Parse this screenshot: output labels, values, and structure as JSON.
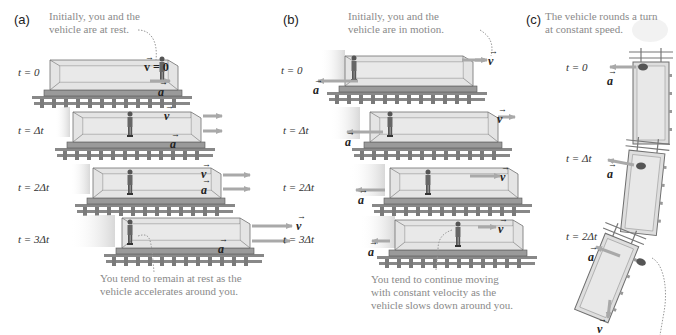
{
  "panels": [
    {
      "id": "a",
      "letter": "(a)",
      "top_caption": [
        "Initially, you and the",
        "vehicle are at rest."
      ],
      "bottom_caption": [
        "You tend to remain at rest as the",
        "vehicle accelerates around you."
      ],
      "initial_velocity_label": "v = 0",
      "rows": [
        {
          "t": "t = 0",
          "v": "",
          "a": "a"
        },
        {
          "t": "t = Δt",
          "v": "v",
          "a": "a"
        },
        {
          "t": "t = 2Δt",
          "v": "v",
          "a": "a"
        },
        {
          "t": "t = 3Δt",
          "v": "v",
          "a": "a"
        }
      ]
    },
    {
      "id": "b",
      "letter": "(b)",
      "top_caption": [
        "Initially, you and the",
        "vehicle are in motion."
      ],
      "bottom_caption": [
        "You tend to continue moving",
        "with constant velocity as the",
        "vehicle slows down around you."
      ],
      "rows": [
        {
          "t": "t = 0",
          "v": "v",
          "a": "a"
        },
        {
          "t": "t = Δt",
          "v": "v",
          "a": "a"
        },
        {
          "t": "t = 2Δt",
          "v": "v",
          "a": "a"
        },
        {
          "t": "t = 3Δt",
          "v": "v",
          "a": "a"
        }
      ]
    },
    {
      "id": "c",
      "letter": "(c)",
      "top_caption": [
        "The vehicle rounds a turn",
        "at constant speed."
      ],
      "rows": [
        {
          "t": "t = 0",
          "a": "a"
        },
        {
          "t": "t = Δt",
          "a": "a"
        },
        {
          "t": "t = 2Δt",
          "a": "a",
          "v": "v"
        }
      ]
    }
  ],
  "colors": {
    "arrow": "#a9a9a9",
    "car_fill": "#e4e4e4",
    "car_edge": "#6f6f6f",
    "caption": "#8a8a8a",
    "shadow": "#dcdcdc"
  }
}
